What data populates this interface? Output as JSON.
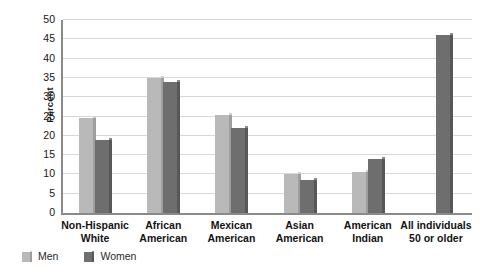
{
  "chart_data": {
    "type": "bar",
    "title": "",
    "xlabel": "",
    "ylabel": "Percent",
    "ylim": [
      0,
      50
    ],
    "yticks": [
      0,
      5,
      10,
      15,
      20,
      25,
      30,
      35,
      40,
      45,
      50
    ],
    "ytick_labels": [
      "0",
      "5",
      "10",
      "15",
      "20",
      "25",
      "30",
      "35",
      "40",
      "45",
      "50"
    ],
    "grid": true,
    "legend_position": "bottom-left",
    "categories": [
      "Non-Hispanic White",
      "African American",
      "Mexican American",
      "Asian American",
      "American Indian",
      "All individuals 50 or older"
    ],
    "category_lines": [
      [
        "Non-Hispanic",
        "White"
      ],
      [
        "African",
        "American"
      ],
      [
        "Mexican",
        "American"
      ],
      [
        "Asian",
        "American"
      ],
      [
        "American",
        "Indian"
      ],
      [
        "All individuals",
        "50 or older"
      ]
    ],
    "series": [
      {
        "name": "Men",
        "color": "#b9b9b9",
        "values": [
          24.5,
          35.0,
          25.5,
          10.0,
          10.5,
          null
        ]
      },
      {
        "name": "Women",
        "color": "#6e6e6e",
        "values": [
          19.0,
          34.0,
          22.0,
          8.5,
          14.0,
          46.0
        ]
      }
    ]
  },
  "legend": {
    "items": [
      {
        "label": "Men",
        "color": "#b9b9b9"
      },
      {
        "label": "Women",
        "color": "#6e6e6e"
      }
    ]
  },
  "axis": {
    "y_title": "Percent"
  }
}
